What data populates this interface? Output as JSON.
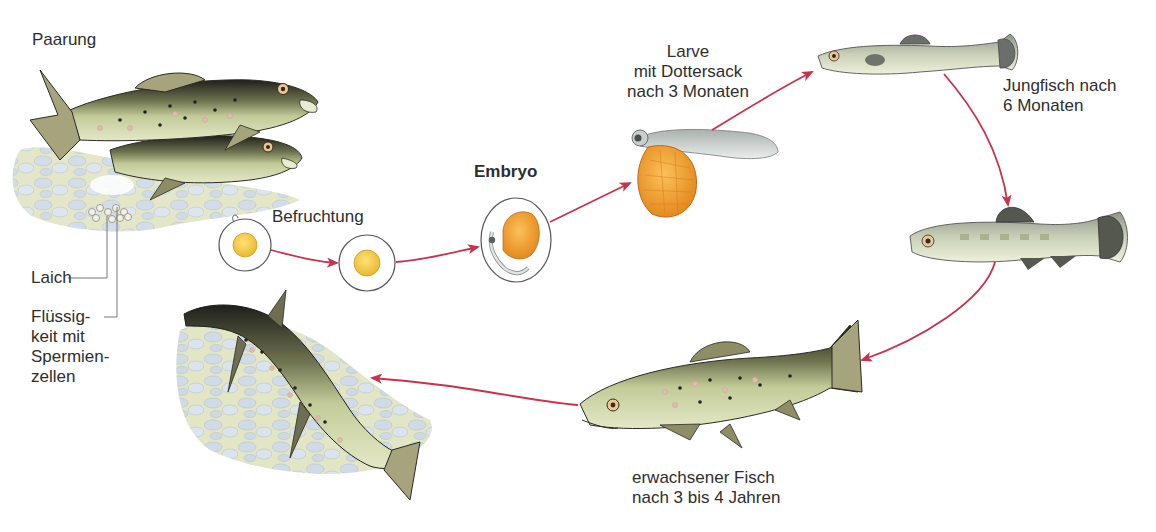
{
  "colors": {
    "arrow": "#c8324a",
    "leader_line": "#777777",
    "yolk": "#f2cf45",
    "yolk_sac": "#f2a93a",
    "fish_body": "#c9d2a2",
    "fish_back": "#2a2a22",
    "gravel": "#c9d6e2",
    "sand": "#dfe3bd"
  },
  "stages": [
    {
      "id": "mating",
      "label": "Paarung"
    },
    {
      "id": "fertilization",
      "label": "Befruchtung"
    },
    {
      "id": "embryo",
      "label": "Embryo"
    },
    {
      "id": "larva",
      "label_lines": [
        "Larve",
        "mit Dottersack",
        "nach 3 Monaten"
      ]
    },
    {
      "id": "juvenile",
      "label_lines": [
        "Jungfisch nach",
        "6 Monaten"
      ]
    },
    {
      "id": "adult",
      "label_lines": [
        "erwachsener Fisch",
        "nach 3 bis 4 Jahren"
      ]
    }
  ],
  "annotations": {
    "spawn": "Laich",
    "sperm_fluid_lines": [
      "Flüssig-",
      "keit mit",
      "Spermien-",
      "zellen"
    ]
  },
  "icons": {
    "mating_pair": "trout-pair-illustration",
    "egg": "egg-cell",
    "fertilized_egg": "fertilized-egg",
    "embryo": "embryo-in-egg",
    "larva": "larva-with-yolk-sac",
    "juvenile_fish_1": "juvenile-fish",
    "juvenile_fish_2": "juvenile-fish-striped",
    "adult_fish": "adult-trout",
    "jumping_fish": "jumping-trout-spawning"
  }
}
